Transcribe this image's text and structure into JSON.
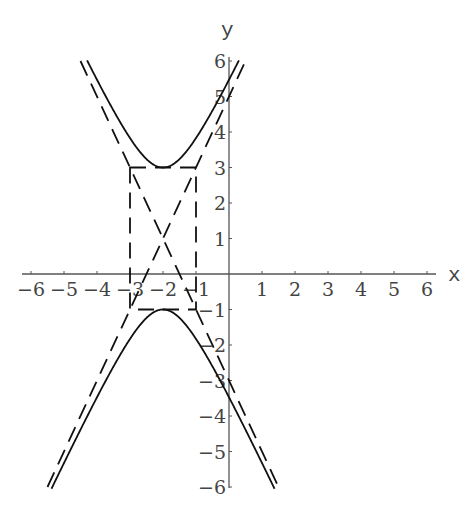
{
  "chart_data": {
    "type": "line",
    "title": "",
    "xlabel": "x",
    "ylabel": "y",
    "xlim": [
      -6,
      6
    ],
    "ylim": [
      -6,
      6
    ],
    "grid": false,
    "x_ticks": [
      -6,
      -5,
      -4,
      -3,
      -2,
      -1,
      1,
      2,
      3,
      4,
      5,
      6
    ],
    "y_ticks": [
      -6,
      -5,
      -4,
      -3,
      -2,
      -1,
      1,
      2,
      3,
      4,
      5,
      6
    ],
    "x_tick_labels": [
      "-6",
      "-5",
      "-4",
      "-3",
      "-2",
      "-1",
      "1",
      "2",
      "3",
      "4",
      "5",
      "6"
    ],
    "y_tick_labels": [
      "-6",
      "-5",
      "-4",
      "-3",
      "-2",
      "-1",
      "1",
      "2",
      "3",
      "4",
      "5",
      "6"
    ],
    "series": [
      {
        "name": "hyperbola",
        "style": "solid",
        "equation": "(y-1)^2/4 - (x+2)^2 = 1",
        "center": [
          -2,
          1
        ],
        "vertices": [
          [
            -2,
            3
          ],
          [
            -2,
            -1
          ]
        ],
        "a": 2,
        "b": 1
      },
      {
        "name": "asymptote-1",
        "style": "dashed",
        "equation": "y = 2x + 5",
        "points": [
          [
            -5.5,
            -6
          ],
          [
            0.5,
            6
          ]
        ]
      },
      {
        "name": "asymptote-2",
        "style": "dashed",
        "equation": "y = -2x - 3",
        "points": [
          [
            -4.5,
            6
          ],
          [
            1.5,
            -6
          ]
        ]
      },
      {
        "name": "central-rectangle",
        "style": "dashed",
        "corners": [
          [
            -3,
            3
          ],
          [
            -1,
            3
          ],
          [
            -1,
            -1
          ],
          [
            -3,
            -1
          ]
        ]
      }
    ],
    "legend": null
  },
  "labels": {
    "x_axis": "x",
    "y_axis": "y"
  }
}
